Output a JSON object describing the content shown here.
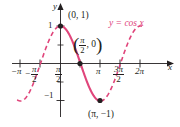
{
  "figure": {
    "background_color": "#ffffff",
    "curve_color": "#e0457b",
    "axis_color": "#231f20",
    "text_color": "#231f20"
  },
  "axes": {
    "y_axis_name": "y",
    "x_axis_name": "x",
    "y_ticks": [
      {
        "label": "1",
        "value": 1
      },
      {
        "label": "−1",
        "value": -1
      }
    ],
    "x_ticks": [
      {
        "label": "−π",
        "value": -3.14159
      },
      {
        "label": "−π/2",
        "numerator": "π",
        "denominator": "2",
        "sign": "−",
        "value": -1.5708
      },
      {
        "label": "π/2",
        "numerator": "π",
        "denominator": "2",
        "value": 1.5708
      },
      {
        "label": "π",
        "value": 3.14159
      },
      {
        "label": "3π/2",
        "numerator": "3π",
        "denominator": "2",
        "value": 4.71239
      },
      {
        "label": "2π",
        "value": 6.28319
      }
    ]
  },
  "curve": {
    "equation_label": "y = cos x",
    "equation_color": "#e0457b"
  },
  "points": [
    {
      "name": "y-intercept",
      "label": "(0, 1)",
      "x": 0,
      "y": 1
    },
    {
      "name": "x-intercept",
      "label": "(π/2, 0)",
      "numerator": "π",
      "denominator": "2",
      "tail": ", 0",
      "x": 1.5708,
      "y": 0
    },
    {
      "name": "minimum",
      "label": "(π, −1)",
      "x": 3.14159,
      "y": -1
    }
  ],
  "chart_data": {
    "type": "line",
    "title": "y = cos x",
    "xlabel": "x",
    "ylabel": "y",
    "xlim": [
      -3.6,
      6.9
    ],
    "ylim": [
      -1.45,
      1.45
    ],
    "grid": false,
    "legend": "none",
    "series": [
      {
        "name": "y = cos x (highlighted on [0, π])",
        "style": "solid",
        "color": "#e0457b",
        "x": [
          0,
          0.3142,
          0.6283,
          0.9425,
          1.2566,
          1.5708,
          1.885,
          2.1991,
          2.5133,
          2.8274,
          3.14159
        ],
        "y": [
          1,
          0.9511,
          0.809,
          0.5878,
          0.309,
          0,
          -0.309,
          -0.5878,
          -0.809,
          -0.9511,
          -1
        ]
      },
      {
        "name": "y = cos x (dashed extension, left)",
        "style": "dashed",
        "color": "#e0457b",
        "x": [
          -3.4,
          -3.14159,
          -2.8274,
          -2.5133,
          -2.1991,
          -1.885,
          -1.5708,
          -1.2566,
          -0.9425,
          -0.6283,
          -0.3142,
          0
        ],
        "y": [
          -0.9668,
          -1,
          -0.9511,
          -0.809,
          -0.5878,
          -0.309,
          0,
          0.309,
          0.5878,
          0.809,
          0.9511,
          1
        ]
      },
      {
        "name": "y = cos x (dashed extension, right)",
        "style": "dashed",
        "color": "#e0457b",
        "x": [
          3.14159,
          3.4558,
          3.7699,
          4.0841,
          4.3982,
          4.7124,
          5.0265,
          5.3407,
          5.6549,
          5.969,
          6.28319,
          6.6
        ],
        "y": [
          -1,
          -0.9511,
          -0.809,
          -0.5878,
          -0.309,
          0,
          0.309,
          0.5878,
          0.809,
          0.9511,
          1,
          0.9506
        ]
      }
    ],
    "annotations": [
      {
        "text": "(0, 1)",
        "x": 0,
        "y": 1
      },
      {
        "text": "(π/2, 0)",
        "x": 1.5708,
        "y": 0
      },
      {
        "text": "(π, −1)",
        "x": 3.14159,
        "y": -1
      },
      {
        "text": "y = cos x",
        "x": 4.5,
        "y": 1.15
      }
    ],
    "marked_points": [
      {
        "x": 0,
        "y": 1
      },
      {
        "x": 1.5708,
        "y": 0
      },
      {
        "x": 3.14159,
        "y": -1
      }
    ]
  }
}
